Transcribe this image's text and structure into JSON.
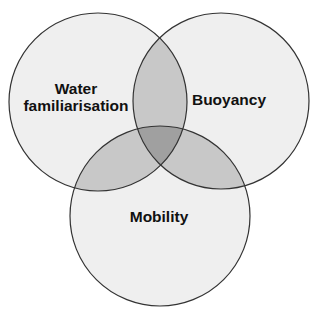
{
  "diagram": {
    "type": "venn",
    "sets": [
      {
        "id": "water",
        "label_lines": [
          "Water",
          "familiarisation"
        ],
        "cx": 98,
        "cy": 102,
        "r": 89
      },
      {
        "id": "buoyancy",
        "label_lines": [
          "Buoyancy"
        ],
        "cx": 221,
        "cy": 101,
        "r": 88
      },
      {
        "id": "mobility",
        "label_lines": [
          "Mobility"
        ],
        "cx": 160,
        "cy": 216,
        "r": 90
      }
    ],
    "colors": {
      "background": "#ffffff",
      "single": "#efefef",
      "pair": "#c8c8c8",
      "triple": "#a0a0a0",
      "stroke": "#333333"
    }
  }
}
